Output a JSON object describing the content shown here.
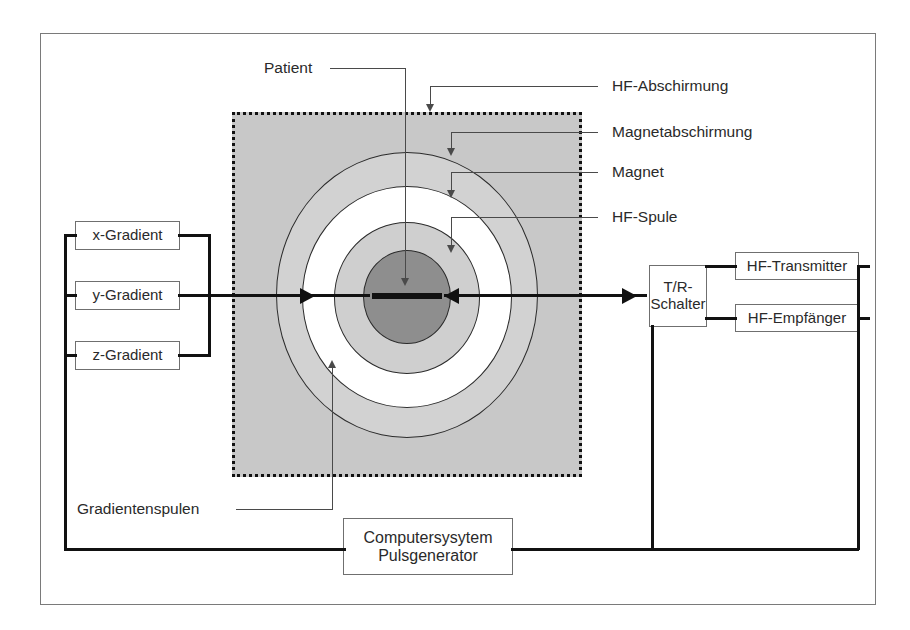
{
  "diagram": {
    "colors": {
      "hf_shield_fill": "#c8c8c8",
      "magnet_shield_fill": "#d2d2d2",
      "magnet_fill": "#ffffff",
      "hf_coil_fill": "#cfcfcf",
      "patient_fill": "#8e8e8e",
      "wire": "#111111",
      "frame": "#7a7a7a"
    }
  },
  "gradients": {
    "x": "x-Gradient",
    "y": "y-Gradient",
    "z": "z-Gradient",
    "group_label": "Gradientenspulen"
  },
  "scanner": {
    "patient_label": "Patient",
    "hf_shield_label": "HF-Abschirmung",
    "magnet_shield_label": "Magnetabschirmung",
    "magnet_label": "Magnet",
    "hf_coil_label": "HF-Spule"
  },
  "rf_chain": {
    "switch_line1": "T/R-",
    "switch_line2": "Schalter",
    "transmitter": "HF-Transmitter",
    "receiver": "HF-Empfänger"
  },
  "computer": {
    "line1": "Computersysytem",
    "line2": "Pulsgenerator"
  }
}
